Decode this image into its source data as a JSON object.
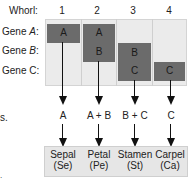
{
  "header": {
    "whorl_label": "Whorl:",
    "whorls": [
      "1",
      "2",
      "3",
      "4"
    ]
  },
  "genes": [
    {
      "prefix": "Gene ",
      "name": "A",
      "suffix": ":"
    },
    {
      "prefix": "Gene ",
      "name": "B",
      "suffix": ":"
    },
    {
      "prefix": "Gene C:",
      "name": "",
      "suffix": ""
    }
  ],
  "boxes": {
    "w1_a": "A",
    "w2_a": "A",
    "w2_b": "B",
    "w3_b": "B",
    "w3_c": "C",
    "w4_c": "C"
  },
  "combinations": [
    "A",
    "A + B",
    "B + C",
    "C"
  ],
  "organs": [
    {
      "name": "Sepal",
      "abbr": "(Se)"
    },
    {
      "name": "Petal",
      "abbr": "(Pe)"
    },
    {
      "name": "Stamen",
      "abbr": "(St)"
    },
    {
      "name": "Carpel",
      "abbr": "(Ca)"
    }
  ],
  "fragments": {
    "left_edge_text": "s.",
    "bottom_left_mark": "."
  },
  "colors": {
    "gene_box": "#6b6b6b",
    "grid_bg": "#ebebeb",
    "organ_bg": "#e6e6e6",
    "line": "#111111"
  }
}
